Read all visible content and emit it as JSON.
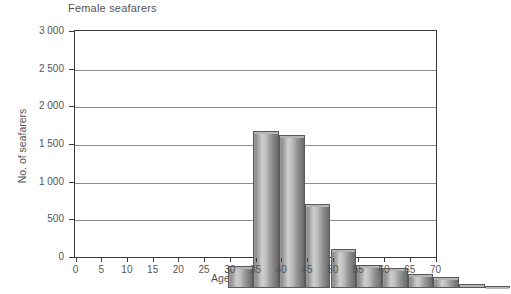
{
  "chart_data": {
    "type": "bar",
    "title": "Female seafarers",
    "xlabel": "Age (average 31.5)",
    "ylabel": "No. of seafarers",
    "categories": [
      "0-5",
      "5-10",
      "10-15",
      "15-20",
      "20-25",
      "25-30",
      "30-35",
      "35-40",
      "40-45",
      "45-50",
      "50-55",
      "55-60",
      "60-65",
      "65-70"
    ],
    "bin_starts": [
      0,
      5,
      10,
      15,
      20,
      25,
      30,
      35,
      40,
      45,
      50,
      55,
      60,
      65
    ],
    "values": [
      0,
      0,
      0,
      290,
      2080,
      2030,
      1120,
      520,
      310,
      270,
      190,
      150,
      55,
      10
    ],
    "xtick_labels": [
      "0",
      "5",
      "10",
      "15",
      "20",
      "25",
      "30",
      "35",
      "40",
      "45",
      "50",
      "55",
      "60",
      "65",
      "70"
    ],
    "xlim": [
      0,
      70
    ],
    "ytick_labels": [
      "0",
      "500",
      "1 000",
      "1 500",
      "2 000",
      "2 500",
      "3 000"
    ],
    "ytick_values": [
      0,
      500,
      1000,
      1500,
      2000,
      2500,
      3000
    ],
    "ylim": [
      0,
      3000
    ],
    "grid": true,
    "legend": "none",
    "bar_color": "#a8a8a8",
    "axis_color": "#3a3a3a",
    "grid_color": "#8d8d8d"
  }
}
